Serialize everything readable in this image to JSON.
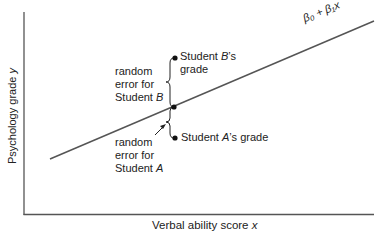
{
  "diagram": {
    "top_cut_text": "Psychology grade",
    "y_axis_label": "Psychology grade",
    "y_axis_var": "y",
    "x_axis_label": "Verbal ability score",
    "x_axis_var": "x",
    "line_label": "β₀ + β₁x",
    "student_b": {
      "point_label_line1_pre": "Student ",
      "point_label_line1_var": "B",
      "point_label_line1_post": "’s",
      "point_label_line2": "grade",
      "error_line1": "random",
      "error_line2": "error for",
      "error_line3_pre": "Student ",
      "error_line3_var": "B"
    },
    "student_a": {
      "point_label_pre": "Student ",
      "point_label_var": "A",
      "point_label_post": "’s grade",
      "error_line1": "random",
      "error_line2": "error for",
      "error_line3_pre": "Student ",
      "error_line3_var": "A"
    },
    "colors": {
      "line": "#555555",
      "axis": "#555555",
      "text": "#222222",
      "point": "#111111"
    }
  }
}
